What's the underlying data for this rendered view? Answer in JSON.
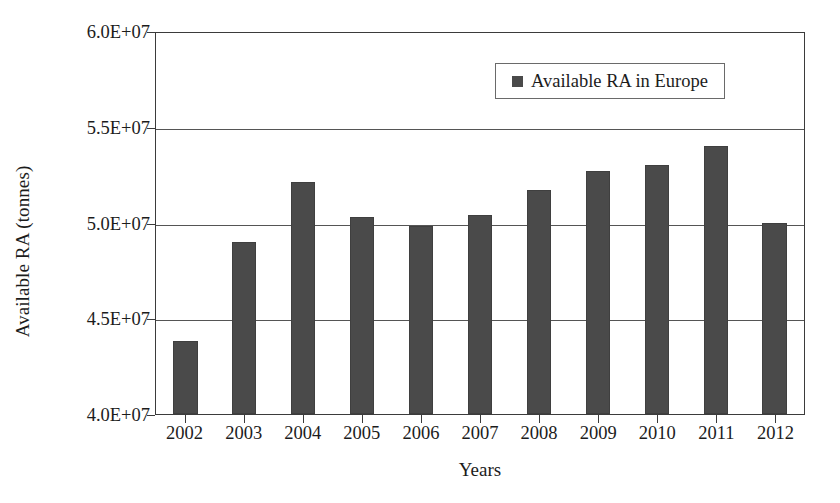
{
  "chart_data": {
    "type": "bar",
    "title": "",
    "subtitle": "",
    "xlabel": "Years",
    "ylabel": "Available RA (tonnes)",
    "categories": [
      "2002",
      "2003",
      "2004",
      "2005",
      "2006",
      "2007",
      "2008",
      "2009",
      "2010",
      "2011",
      "2012"
    ],
    "series": [
      {
        "name": "Available RA in Europe",
        "color": "#4a4a4a",
        "values": [
          43800000,
          49000000,
          52100000,
          50300000,
          49800000,
          50400000,
          51700000,
          52700000,
          53000000,
          54000000,
          50000000
        ]
      }
    ],
    "ylim": [
      40000000,
      60000000
    ],
    "ytick_values": [
      40000000,
      45000000,
      50000000,
      55000000,
      60000000
    ],
    "ytick_labels": [
      "4.0E+07",
      "4.5E+07",
      "5.0E+07",
      "5.5E+07",
      "6.0E+07"
    ],
    "grid": "horizontal",
    "legend_position": "top-right-inside",
    "legend_entries": [
      "Available RA in Europe"
    ],
    "annotations": []
  },
  "legend": {
    "label": "Available RA in Europe",
    "swatch_color": "#4a4a4a"
  },
  "axes": {
    "y_title": "Available RA (tonnes)",
    "x_title": "Years"
  }
}
